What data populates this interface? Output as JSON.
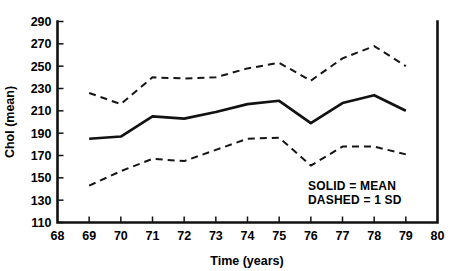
{
  "chart_data": {
    "type": "line",
    "title": "",
    "xlabel": "Time (years)",
    "ylabel": "Chol (mean)",
    "x": [
      69,
      70,
      71,
      72,
      73,
      74,
      75,
      76,
      77,
      78,
      79
    ],
    "xlim": [
      68,
      80
    ],
    "ylim": [
      110,
      290
    ],
    "xticks": [
      68,
      69,
      70,
      71,
      72,
      73,
      74,
      75,
      76,
      77,
      78,
      79,
      80
    ],
    "xtick_labels": [
      "68",
      "69",
      "70",
      "71",
      "72",
      "73",
      "74",
      "75",
      "76",
      "77",
      "78",
      "79",
      "80"
    ],
    "yticks": [
      110,
      130,
      150,
      170,
      190,
      210,
      230,
      250,
      270,
      290
    ],
    "ytick_labels": [
      "110",
      "130",
      "150",
      "170",
      "190",
      "210",
      "230",
      "250",
      "270",
      "290"
    ],
    "grid": false,
    "legend_position": "inside-lower-right",
    "series": [
      {
        "name": "+1 SD",
        "style": "dashed",
        "values": [
          226,
          216,
          240,
          239,
          240,
          248,
          253,
          237,
          257,
          268,
          250
        ]
      },
      {
        "name": "MEAN",
        "style": "solid",
        "values": [
          185,
          187,
          205,
          203,
          209,
          216,
          219,
          199,
          217,
          224,
          210
        ]
      },
      {
        "name": "-1 SD",
        "style": "dashed",
        "values": [
          143,
          156,
          167,
          165,
          175,
          185,
          186,
          161,
          178,
          178,
          171
        ]
      }
    ],
    "annotations": [
      "SOLID = MEAN",
      "DASHED = 1 SD"
    ]
  },
  "legend": {
    "line1": "SOLID = MEAN",
    "line2": "DASHED = 1 SD"
  },
  "colors": {
    "line": "#121212",
    "axis": "#111111",
    "background": "#ffffff"
  }
}
